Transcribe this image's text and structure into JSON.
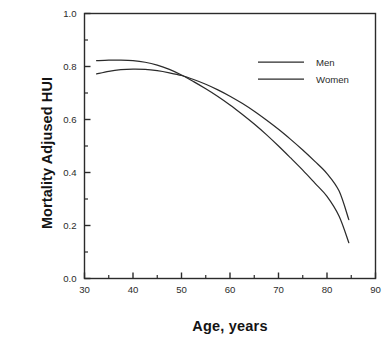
{
  "chart_data": {
    "type": "line",
    "title": "",
    "xlabel": "Age, years",
    "ylabel": "Mortality Adjused HUI",
    "xlim": [
      30,
      90
    ],
    "ylim": [
      0.0,
      1.0
    ],
    "xticks": [
      30,
      40,
      50,
      60,
      70,
      80,
      90
    ],
    "xtick_labels": [
      "30",
      "40",
      "50",
      "60",
      "70",
      "80",
      "90"
    ],
    "xminor_step": 5,
    "yticks": [
      0.0,
      0.2,
      0.4,
      0.6,
      0.8,
      1.0
    ],
    "ytick_labels": [
      "0.0",
      "0.2",
      "0.4",
      "0.6",
      "0.8",
      "1.0"
    ],
    "yminor_step": 0.1,
    "grid": false,
    "legend_position": "top-right-inside",
    "x": [
      32.5,
      35,
      37.5,
      40,
      42.5,
      45,
      47.5,
      50,
      52.5,
      55,
      57.5,
      60,
      62.5,
      65,
      67.5,
      70,
      72.5,
      75,
      77.5,
      80,
      82.5,
      84.5
    ],
    "series": [
      {
        "name": "Men",
        "color": "#2b2b2b",
        "values": [
          0.822,
          0.824,
          0.824,
          0.822,
          0.816,
          0.805,
          0.789,
          0.768,
          0.743,
          0.716,
          0.687,
          0.655,
          0.62,
          0.583,
          0.543,
          0.5,
          0.455,
          0.409,
          0.36,
          0.31,
          0.235,
          0.135
        ]
      },
      {
        "name": "Women",
        "color": "#2b2b2b",
        "values": [
          0.772,
          0.782,
          0.788,
          0.79,
          0.789,
          0.784,
          0.776,
          0.766,
          0.751,
          0.733,
          0.712,
          0.688,
          0.661,
          0.631,
          0.598,
          0.563,
          0.525,
          0.485,
          0.442,
          0.396,
          0.33,
          0.222
        ]
      }
    ]
  },
  "legend": {
    "entries": [
      {
        "label": "Men"
      },
      {
        "label": "Women"
      }
    ]
  },
  "axes": {
    "x_title": "Age, years",
    "y_title": "Mortality Adjused HUI"
  }
}
